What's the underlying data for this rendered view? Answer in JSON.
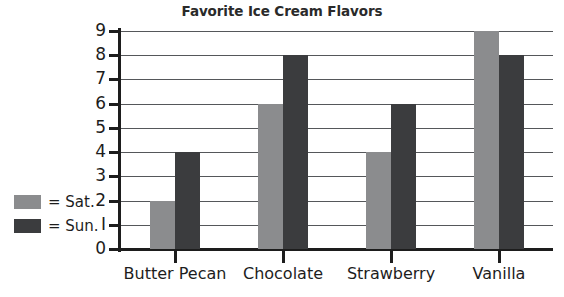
{
  "chart_data": {
    "type": "bar",
    "title": "Favorite Ice Cream Flavors",
    "xlabel": "",
    "ylabel": "",
    "categories": [
      "Butter Pecan",
      "Chocolate",
      "Strawberry",
      "Vanilla"
    ],
    "series": [
      {
        "name": "= Sat.",
        "key": "sat",
        "color": "#8b8c8e",
        "values": [
          2,
          6,
          4,
          9
        ]
      },
      {
        "name": "= Sun.",
        "key": "sun",
        "color": "#3b3c3e",
        "values": [
          4,
          8,
          6,
          8
        ]
      }
    ],
    "ylim": [
      0,
      9
    ],
    "yticks": [
      "0",
      "I",
      "2",
      "3",
      "4",
      "5",
      "6",
      "7",
      "8",
      "9"
    ],
    "grid": true,
    "legend_position": "left-middle"
  },
  "legend": {
    "items": [
      {
        "label": "= Sat.",
        "color": "#8b8c8e"
      },
      {
        "label": "= Sun.",
        "color": "#3b3c3e"
      }
    ]
  },
  "colors": {
    "background": "#ffffff",
    "axis": "#1d1d1d",
    "grid": "#55575a",
    "saturday": "#8b8c8e",
    "sunday": "#3b3c3e"
  }
}
